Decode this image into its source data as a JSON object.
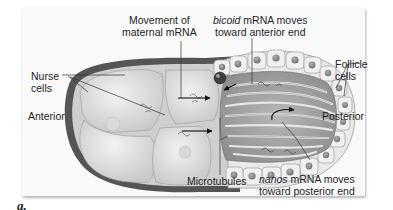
{
  "figure": {
    "panel_label": "a.",
    "labels": {
      "movement_line1": "Movement  of",
      "movement_line2": "maternal mRNA",
      "bicoid_italic": "bicoid",
      "bicoid_rest": " mRNA moves",
      "bicoid_line2": "toward anterior end",
      "nurse_line1": "Nurse",
      "nurse_line2": "cells",
      "follicle_line1": "Follicle",
      "follicle_line2": "cells",
      "anterior": "Anterior",
      "posterior": "Posterior",
      "microtubules": "Microtubules",
      "nanos_italic": "nanos",
      "nanos_rest": " mRNA moves",
      "nanos_line2": "toward posterior end"
    },
    "colors": {
      "background": "#ffffff",
      "panel": "#f9f9f9",
      "egg_outline": "#4a4a4a",
      "cytoplasm": "#d6d6d6",
      "nurse_cell": "#e4e4e4",
      "follicle_cell": "#ececec",
      "nucleus": "#8a8a8a",
      "text": "#1f1f1f"
    }
  }
}
